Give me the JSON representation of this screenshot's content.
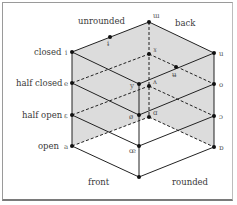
{
  "diagram": {
    "labels": {
      "unrounded": "unrounded",
      "back": "back",
      "front": "front",
      "rounded": "rounded",
      "closed": "closed",
      "half_closed": "half closed",
      "half_open": "half open",
      "open": "open"
    },
    "vowels": {
      "front_unrounded": [
        "i",
        "e",
        "ε",
        "a"
      ],
      "front_rounded": [
        "y",
        "ø",
        "œ"
      ],
      "back_unrounded": [
        "ɯ",
        "ɤ",
        "ʌ",
        "ɑ"
      ],
      "back_rounded": [
        "u",
        "o",
        "ɔ",
        "ɒ"
      ],
      "central_unrounded": "ɨ",
      "central_rounded": "ʉ"
    },
    "colors": {
      "shade": "#dcdcdc",
      "line": "#222222",
      "frame": "#9a9a9a"
    }
  }
}
